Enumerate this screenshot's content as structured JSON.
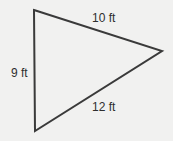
{
  "diagram": {
    "shape": "triangle",
    "stroke_color": "#3a3a3a",
    "background_color": "#f1f1f0",
    "vertices": {
      "top": [
        34,
        10
      ],
      "right": [
        162,
        51
      ],
      "bottom": [
        35,
        131
      ]
    },
    "sides": {
      "top": {
        "label": "10 ft",
        "length": 10,
        "unit": "ft"
      },
      "left": {
        "label": "9 ft",
        "length": 9,
        "unit": "ft"
      },
      "bottom": {
        "label": "12 ft",
        "length": 12,
        "unit": "ft"
      }
    }
  }
}
